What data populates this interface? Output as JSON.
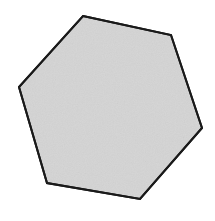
{
  "figure": {
    "name": "hexagon",
    "shape_type": "hexagon",
    "sides": 6,
    "label": "Hexagon",
    "fill_color": "#d6d6d6",
    "stroke_color": "#1a1a1a",
    "stroke_width": 2,
    "background_color": "#ffffff",
    "texture": "paper-grain",
    "canvas": {
      "width": 215,
      "height": 221
    },
    "vertices": [
      {
        "x": 83,
        "y": 16
      },
      {
        "x": 171,
        "y": 35
      },
      {
        "x": 202,
        "y": 128
      },
      {
        "x": 140,
        "y": 199
      },
      {
        "x": 47,
        "y": 183
      },
      {
        "x": 19,
        "y": 87
      }
    ],
    "points_attr": "83,16 171,35 202,128 140,199 47,183 19,87"
  }
}
